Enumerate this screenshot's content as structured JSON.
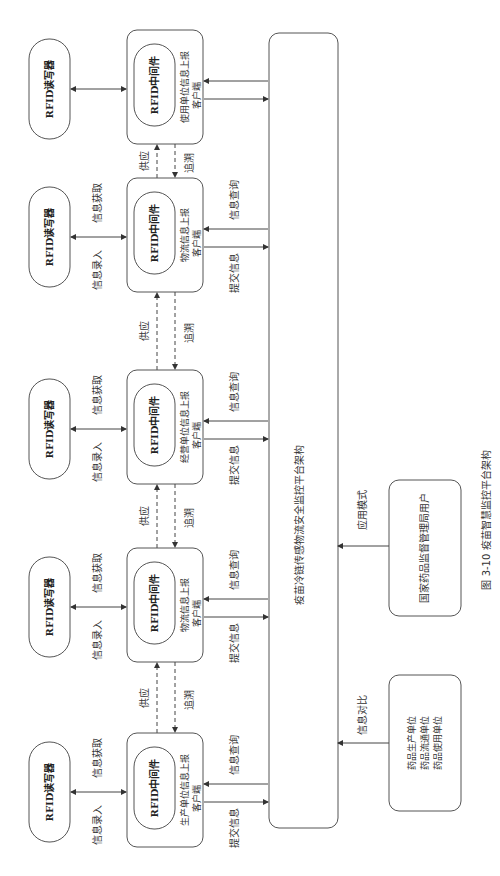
{
  "figure": {
    "caption": "图 3-10   疫苗智慧监控平台架构",
    "platform_label": "疫苗冷链传感物流安全监控平台架构",
    "reader_label": "RFID读写器",
    "middleware_label": "RFID中间件",
    "client_suffix": "客户端",
    "stages": [
      {
        "client": "使用单位信息上报"
      },
      {
        "client": "物流信息上报"
      },
      {
        "client": "经营单位信息上报"
      },
      {
        "client": "物流信息上报"
      },
      {
        "client": "生产单位信息上报"
      }
    ],
    "edge_labels": {
      "input": "信息录入",
      "fetch": "信息获取",
      "supply": "供应",
      "trace": "追溯",
      "query": "信息查询",
      "submit": "提交信息",
      "app_mode": "应用模式",
      "compare": "信息对比"
    },
    "users": {
      "regulator": "国家药品监督管理局用户",
      "units": [
        "药品生产单位",
        "药品流通单位",
        "药品使用单位"
      ]
    }
  }
}
